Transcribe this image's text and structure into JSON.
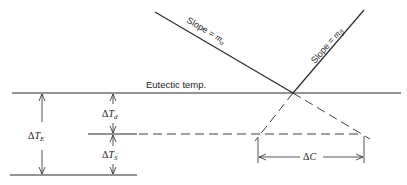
{
  "diagram": {
    "eutectic_label": "Eutectic temp.",
    "slope_alpha": {
      "prefix": "Slope = ",
      "var": "m",
      "sub": "α"
    },
    "slope_beta": {
      "prefix": "Slope = ",
      "var": "m",
      "sub": "β"
    },
    "dT_E": {
      "delta": "Δ",
      "var": "T",
      "sub": "E"
    },
    "dT_d": {
      "delta": "Δ",
      "var": "T",
      "sub": "d"
    },
    "dT_S": {
      "delta": "Δ",
      "var": "T",
      "sub": "S"
    },
    "dC": {
      "delta": "Δ",
      "var": "C"
    },
    "colors": {
      "line": "#2a2a2a",
      "background": "#ffffff"
    }
  }
}
